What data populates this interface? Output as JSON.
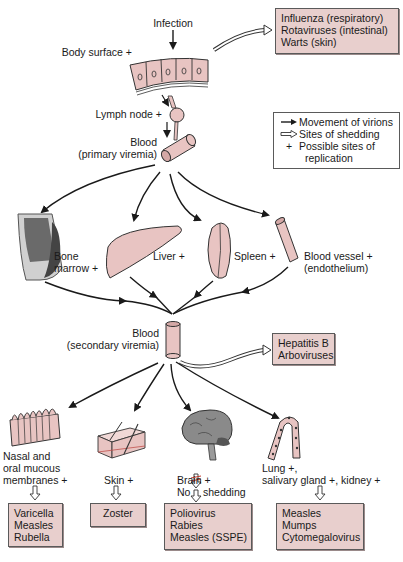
{
  "diagram": {
    "type": "flow"
  },
  "colors": {
    "tissue_fill": "#e8c4c2",
    "box_fill": "#e8cfcd",
    "box_border": "#5a5a5a",
    "arrow": "#1a1a1a",
    "brain_gray": "#8a8a8a",
    "no_shedding_mark": "#c0392b"
  },
  "entry": {
    "infection": "Infection",
    "body_surface": "Body surface +",
    "lymph_node": "Lymph node +",
    "blood_primary_line1": "Blood",
    "blood_primary_line2": "(primary viremia)"
  },
  "shedding_top": {
    "items": [
      "Influenza (respiratory)",
      "Rotaviruses (intestinal)",
      "Warts (skin)"
    ]
  },
  "legend": {
    "items": [
      {
        "symbol": "solid-arrow",
        "label": "Movement of virions"
      },
      {
        "symbol": "hollow-arrow",
        "label": "Sites of shedding"
      },
      {
        "symbol": "+",
        "label": "Possible sites of"
      },
      {
        "symbol": "",
        "label": "replication"
      }
    ]
  },
  "organs_primary": {
    "bone_marrow_line1": "Bone",
    "bone_marrow_line2": "marrow +",
    "liver": "Liver +",
    "spleen": "Spleen +",
    "blood_vessel_line1": "Blood vessel +",
    "blood_vessel_line2": "(endothelium)"
  },
  "secondary": {
    "blood_line1": "Blood",
    "blood_line2": "(secondary viremia)",
    "shedding_items": [
      "Hepatitis B",
      "Arboviruses"
    ]
  },
  "targets": [
    {
      "label_lines": [
        "Nasal and",
        "oral mucous",
        "membranes +"
      ],
      "shedding": [
        "Varicella",
        "Measles",
        "Rubella"
      ]
    },
    {
      "label_lines": [
        "Skin +"
      ],
      "shedding": [
        "Zoster"
      ]
    },
    {
      "label_lines": [
        "Brain +",
        "No",
        "shedding"
      ],
      "shedding": [
        "Poliovirus",
        "Rabies",
        "Measles (SSPE)"
      ]
    },
    {
      "label_lines": [
        "Lung +,",
        "salivary gland +, kidney +"
      ],
      "shedding": [
        "Measles",
        "Mumps",
        "Cytomegalovirus"
      ]
    }
  ]
}
